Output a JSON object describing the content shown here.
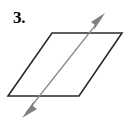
{
  "figure": {
    "label": "3.",
    "background_color": "#ffffff",
    "width": 129,
    "height": 124,
    "shape": {
      "name": "parallelogram",
      "stroke_color": "#2a2a2a",
      "stroke_width": 1.6,
      "fill": "none",
      "vertices": [
        {
          "name": "top-left",
          "x": 52,
          "y": 33
        },
        {
          "name": "top-right",
          "x": 122,
          "y": 33
        },
        {
          "name": "bottom-right",
          "x": 79,
          "y": 96
        },
        {
          "name": "bottom-left",
          "x": 8,
          "y": 96
        }
      ],
      "points_attr": "52,33 122,33 79,96 8,96"
    },
    "arrow": {
      "name": "double-headed-diagonal-arrow",
      "stroke_color": "#8c8c8c",
      "head_color": "#808080",
      "stroke_width": 1.3,
      "start": {
        "x": 22,
        "y": 118
      },
      "end": {
        "x": 105,
        "y": 13
      },
      "line_x1": 26,
      "line_y1": 113,
      "line_x2": 101,
      "line_y2": 18,
      "head_top_points": "105,13 91,22 95,25 94,30",
      "head_bottom_points": "22,118 37,109 33,106 34,101",
      "crosses_bottom_edge_at": {
        "x": 37,
        "y": 96
      },
      "crosses_top_edge_at": {
        "x": 91,
        "y": 33
      }
    }
  }
}
